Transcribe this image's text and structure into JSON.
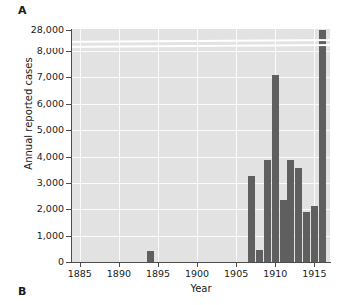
{
  "figure": {
    "panel_a_label": "A",
    "panel_b_label": "B"
  },
  "chart_data": {
    "type": "bar",
    "title": "",
    "xlabel": "Year",
    "ylabel": "Annual reported cases",
    "x": [
      1894,
      1907,
      1908,
      1909,
      1910,
      1911,
      1912,
      1913,
      1914,
      1915,
      1916
    ],
    "values": [
      400,
      3250,
      450,
      3880,
      7080,
      2350,
      3870,
      3580,
      1880,
      2140,
      28000
    ],
    "categories": [
      "1894",
      "1907",
      "1908",
      "1909",
      "1910",
      "1911",
      "1912",
      "1913",
      "1914",
      "1915",
      "1916"
    ],
    "xlim": [
      1884,
      1917
    ],
    "ylim": [
      0,
      8000
    ],
    "y_broken_axis": true,
    "y_break_between": [
      8000,
      28000
    ],
    "y_tick_labels": [
      "0",
      "1,000",
      "2,000",
      "3,000",
      "4,000",
      "5,000",
      "6,000",
      "7,000",
      "8,000",
      "28,000"
    ],
    "y_tick_values": [
      0,
      1000,
      2000,
      3000,
      4000,
      5000,
      6000,
      7000,
      8000,
      28000
    ],
    "x_tick_labels": [
      "1885",
      "1890",
      "1895",
      "1900",
      "1905",
      "1910",
      "1915"
    ],
    "x_tick_values": [
      1885,
      1890,
      1895,
      1900,
      1905,
      1910,
      1915
    ],
    "grid": true,
    "legend": "none",
    "bar_color": "#5f5f5f",
    "plot_background": "#e2e2e2",
    "gridline_color": "#fbfbfb"
  }
}
